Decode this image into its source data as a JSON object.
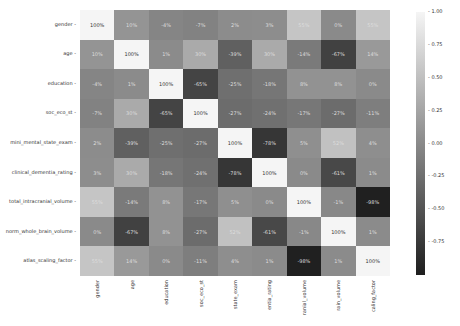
{
  "chart_data": {
    "type": "heatmap",
    "title": "",
    "labels_y": [
      "gender",
      "age",
      "education",
      "soc_eco_st",
      "mini_mental_state_exam",
      "clinical_dementia_rating",
      "total_intracranial_volume",
      "norm_whole_brain_volume",
      "atlas_scaling_factor"
    ],
    "labels_x_visible": [
      "gender",
      "age",
      "education",
      "soc_eco_st",
      "state_exam",
      "entia_rating",
      "ranial_volume",
      "rain_volume",
      "caling_factor"
    ],
    "matrix": [
      [
        100,
        10,
        -4,
        -7,
        2,
        3,
        55,
        0,
        55
      ],
      [
        10,
        100,
        1,
        30,
        -39,
        30,
        -14,
        -67,
        14
      ],
      [
        -4,
        1,
        100,
        -65,
        -25,
        -18,
        8,
        8,
        0
      ],
      [
        -7,
        30,
        -65,
        100,
        -27,
        -24,
        -17,
        -27,
        -11
      ],
      [
        2,
        -39,
        -25,
        -27,
        100,
        -78,
        5,
        52,
        4
      ],
      [
        3,
        30,
        -18,
        -24,
        -78,
        100,
        0,
        -61,
        1
      ],
      [
        55,
        -14,
        8,
        -17,
        5,
        0,
        100,
        -1,
        -98
      ],
      [
        0,
        -67,
        8,
        -27,
        52,
        -61,
        -1,
        100,
        1
      ],
      [
        55,
        14,
        0,
        -11,
        4,
        1,
        -98,
        1,
        100
      ]
    ],
    "format": "percent",
    "colormap": "grayscale",
    "colorbar": {
      "min": -1.0,
      "max": 1.0,
      "ticks": [
        "1.00",
        "0.75",
        "0.50",
        "0.25",
        "0.00",
        "-0.25",
        "-0.50",
        "-0.75"
      ]
    }
  }
}
